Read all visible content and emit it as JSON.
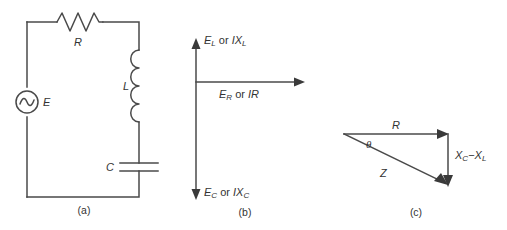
{
  "figure": {
    "background_color": "#ffffff",
    "line_color": "#4a4a4a",
    "text_color": "#333333",
    "width": 507,
    "height": 230
  },
  "panels": [
    {
      "id": "a",
      "caption": "(a)",
      "name": "series-rlc-circuit",
      "components": [
        {
          "symbol": "R",
          "type": "resistor",
          "label": "R"
        },
        {
          "symbol": "L",
          "type": "inductor",
          "label": "L"
        },
        {
          "symbol": "C",
          "type": "capacitor",
          "label": "C"
        },
        {
          "symbol": "E",
          "type": "ac-source",
          "label": "E"
        }
      ]
    },
    {
      "id": "b",
      "caption": "(b)",
      "name": "voltage-phasor-diagram",
      "phasors": [
        {
          "direction": "up",
          "name": "inductive-phasor",
          "parts": [
            "E",
            "L",
            " or ",
            "I",
            "X",
            "L"
          ],
          "text": "EL or IXL"
        },
        {
          "direction": "right",
          "name": "resistive-phasor",
          "parts": [
            "E",
            "R",
            " or ",
            "IR"
          ],
          "text": "ER or IR"
        },
        {
          "direction": "down",
          "name": "capacitive-phasor",
          "parts": [
            "E",
            "C",
            " or ",
            "I",
            "X",
            "C"
          ],
          "text": "EC or IXC"
        }
      ]
    },
    {
      "id": "c",
      "caption": "(c)",
      "name": "impedance-triangle",
      "sides": [
        {
          "name": "resistance-side",
          "label": "R",
          "orientation": "horizontal"
        },
        {
          "name": "reactance-side",
          "label": "XC − XL",
          "orientation": "vertical"
        },
        {
          "name": "impedance-side",
          "label": "Z",
          "orientation": "hypotenuse"
        }
      ],
      "angle": {
        "name": "phase-angle",
        "label": "θ"
      }
    }
  ],
  "labels": {
    "resistor": "R",
    "inductor": "L",
    "capacitor": "C",
    "source": "E",
    "phasor_up_main": "E",
    "phasor_up_sub": "L",
    "phasor_up_conj": " or ",
    "phasor_up_cur": "I",
    "phasor_up_react": "X",
    "phasor_up_react_sub": "L",
    "phasor_right_main": "E",
    "phasor_right_sub": "R",
    "phasor_right_conj": " or ",
    "phasor_right_tail": "IR",
    "phasor_down_main": "E",
    "phasor_down_sub": "C",
    "phasor_down_conj": " or ",
    "phasor_down_cur": "I",
    "phasor_down_react": "X",
    "phasor_down_react_sub": "C",
    "tri_r": "R",
    "tri_xc": "X",
    "tri_xc_sub": "C",
    "tri_minus": "−",
    "tri_xl": "X",
    "tri_xl_sub": "L",
    "tri_z": "Z",
    "tri_theta": "θ",
    "caption_a": "(a)",
    "caption_b": "(b)",
    "caption_c": "(c)"
  }
}
